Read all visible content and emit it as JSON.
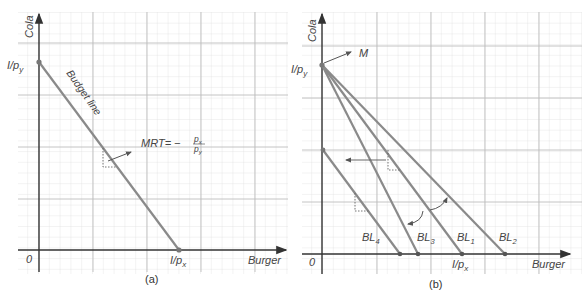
{
  "colors": {
    "grid_minor": "#e2e2e2",
    "grid_major": "#b8b8b8",
    "axis": "#444444",
    "budget_line": "#8a8a8a",
    "text": "#444444",
    "point": "#777777"
  },
  "panel_a": {
    "caption": "(a)",
    "y_axis_label": "Cola",
    "x_axis_label": "Burger",
    "origin_label": "0",
    "y_intercept_label": "I/p",
    "y_intercept_sub": "y",
    "x_intercept_label": "I/p",
    "x_intercept_sub": "x",
    "line_label": "Budget line",
    "mrt_label": "MRT= −",
    "mrt_num": "p",
    "mrt_num_sub": "x",
    "mrt_den": "p",
    "mrt_den_sub": "y"
  },
  "panel_b": {
    "caption": "(b)",
    "y_axis_label": "Cola",
    "x_axis_label": "Burger",
    "origin_label": "0",
    "y_intercept_label": "I/p",
    "y_intercept_sub": "y",
    "x_intercept_label": "I/p",
    "x_intercept_sub": "x",
    "m_label": "M",
    "lines": [
      {
        "name": "BL",
        "sub": "4"
      },
      {
        "name": "BL",
        "sub": "3"
      },
      {
        "name": "BL",
        "sub": "1"
      },
      {
        "name": "BL",
        "sub": "2"
      }
    ]
  }
}
